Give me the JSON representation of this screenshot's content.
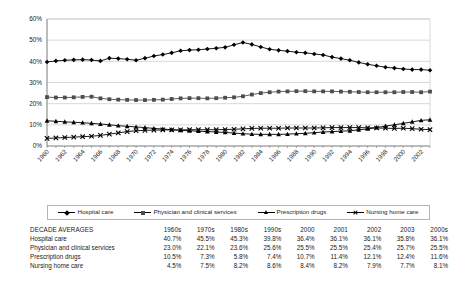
{
  "chart_data": {
    "type": "line",
    "title": "",
    "xlabel": "",
    "ylabel": "",
    "ylim": [
      0,
      60
    ],
    "ytick_labels": [
      "0%",
      "10%",
      "20%",
      "30%",
      "40%",
      "50%",
      "60%"
    ],
    "ytick_values": [
      0,
      10,
      20,
      30,
      40,
      50,
      60
    ],
    "grid": true,
    "legend_position": "below-axes",
    "x": [
      1960,
      1961,
      1962,
      1963,
      1964,
      1965,
      1966,
      1967,
      1968,
      1969,
      1970,
      1971,
      1972,
      1973,
      1974,
      1975,
      1976,
      1977,
      1978,
      1979,
      1980,
      1981,
      1982,
      1983,
      1984,
      1985,
      1986,
      1987,
      1988,
      1989,
      1990,
      1991,
      1992,
      1993,
      1994,
      1995,
      1996,
      1997,
      1998,
      1999,
      2000,
      2001,
      2002,
      2003
    ],
    "xtick_labels": [
      "1960",
      "1962",
      "1964",
      "1966",
      "1968",
      "1970",
      "1972",
      "1974",
      "1976",
      "1978",
      "1980",
      "1982",
      "1984",
      "1986",
      "1988",
      "1990",
      "1992",
      "1994",
      "1996",
      "1998",
      "2000",
      "2002"
    ],
    "series": [
      {
        "name": "Hospital care",
        "marker": "diamond",
        "color": "#000000",
        "values": [
          39.7,
          40.2,
          40.5,
          40.7,
          40.8,
          40.6,
          40.2,
          41.5,
          41.3,
          41.0,
          40.5,
          41.5,
          42.5,
          43.2,
          44.0,
          45.0,
          45.3,
          45.5,
          45.8,
          46.2,
          46.6,
          47.8,
          48.9,
          48.0,
          46.8,
          45.7,
          45.2,
          44.8,
          44.3,
          44.0,
          43.5,
          43.0,
          42.0,
          41.3,
          40.5,
          39.5,
          38.6,
          37.9,
          37.2,
          36.8,
          36.4,
          36.1,
          36.1,
          35.8
        ]
      },
      {
        "name": "Physician and clinical services",
        "marker": "square",
        "color": "#4d4d4d",
        "values": [
          23.1,
          22.9,
          22.9,
          23.0,
          23.2,
          23.3,
          22.5,
          22.1,
          21.9,
          21.8,
          21.7,
          21.7,
          21.8,
          21.9,
          22.2,
          22.5,
          22.6,
          22.6,
          22.5,
          22.6,
          22.8,
          23.0,
          23.5,
          24.3,
          25.0,
          25.4,
          25.7,
          25.8,
          25.9,
          25.9,
          25.8,
          25.8,
          25.8,
          25.7,
          25.6,
          25.5,
          25.4,
          25.4,
          25.4,
          25.4,
          25.5,
          25.5,
          25.4,
          25.7
        ]
      },
      {
        "name": "Prescription drugs",
        "marker": "triangle",
        "color": "#000000",
        "values": [
          11.9,
          11.7,
          11.4,
          11.2,
          11.0,
          10.7,
          10.4,
          10.0,
          9.6,
          9.3,
          9.0,
          8.7,
          8.3,
          8.0,
          7.7,
          7.4,
          7.2,
          7.0,
          6.8,
          6.6,
          6.4,
          6.1,
          5.8,
          5.6,
          5.5,
          5.5,
          5.5,
          5.6,
          5.8,
          6.0,
          6.3,
          6.6,
          6.8,
          7.0,
          7.2,
          7.6,
          8.1,
          8.7,
          9.4,
          10.0,
          10.7,
          11.4,
          12.1,
          12.4
        ]
      },
      {
        "name": "Nursing home care",
        "marker": "cross",
        "color": "#000000",
        "values": [
          3.6,
          3.8,
          4.0,
          4.2,
          4.4,
          4.6,
          5.0,
          5.6,
          6.2,
          6.8,
          7.2,
          7.4,
          7.5,
          7.6,
          7.6,
          7.6,
          7.7,
          7.7,
          7.7,
          7.7,
          7.8,
          7.9,
          8.1,
          8.3,
          8.4,
          8.4,
          8.4,
          8.5,
          8.5,
          8.5,
          8.5,
          8.6,
          8.7,
          8.7,
          8.7,
          8.7,
          8.6,
          8.5,
          8.4,
          8.3,
          8.4,
          8.2,
          7.9,
          7.7
        ]
      }
    ]
  },
  "legend": {
    "entries": [
      {
        "label": "Hospital care",
        "marker": "diamond"
      },
      {
        "label": "Physician and clinical services",
        "marker": "square"
      },
      {
        "label": "Prescription drugs",
        "marker": "triangle"
      },
      {
        "label": "Nursing home care",
        "marker": "cross"
      }
    ]
  },
  "table": {
    "header": [
      "DECADE AVERAGES",
      "1960s",
      "1970s",
      "1980s",
      "1990s",
      "2000",
      "2001",
      "2002",
      "2003",
      "2000s"
    ],
    "rows": [
      {
        "label": "Hospital care",
        "values": [
          "40.7%",
          "45.5%",
          "45.3%",
          "39.8%",
          "36.4%",
          "36.1%",
          "36.1%",
          "35.8%",
          "36.1%"
        ]
      },
      {
        "label": "Physician and clinical services",
        "values": [
          "23.0%",
          "22.1%",
          "23.6%",
          "25.6%",
          "25.5%",
          "25.5%",
          "25.4%",
          "25.7%",
          "25.5%"
        ]
      },
      {
        "label": "Prescription drugs",
        "values": [
          "10.5%",
          "7.3%",
          "5.8%",
          "7.4%",
          "10.7%",
          "11.4%",
          "12.1%",
          "12.4%",
          "11.6%"
        ]
      },
      {
        "label": "Nursing home care",
        "values": [
          "4.5%",
          "7.5%",
          "8.2%",
          "8.6%",
          "8.4%",
          "8.2%",
          "7.9%",
          "7.7%",
          "8.1%"
        ]
      }
    ]
  }
}
